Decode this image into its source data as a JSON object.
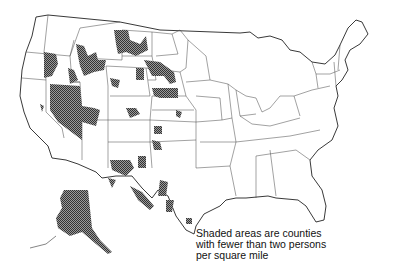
{
  "map": {
    "title": "",
    "region": "United States (contiguous) with Alaska inset",
    "legend": {
      "lines": [
        "Shaded areas are counties",
        "with fewer than two persons",
        "per square mile"
      ]
    },
    "colors": {
      "background": "#ffffff",
      "state_line": "#333333",
      "shade": "#555555"
    },
    "shaded_regions": [
      "Montana",
      "Wyoming",
      "Idaho",
      "Oregon",
      "Nevada",
      "Utah",
      "North Dakota",
      "South Dakota",
      "Nebraska",
      "Colorado",
      "New Mexico",
      "Texas",
      "Arizona",
      "California",
      "Alaska"
    ]
  }
}
